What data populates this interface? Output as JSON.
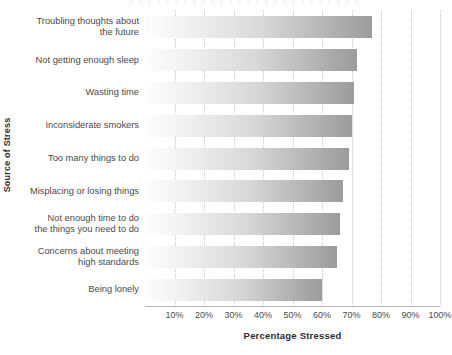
{
  "chart_data": {
    "type": "bar",
    "orientation": "horizontal",
    "title": "",
    "xlabel": "Percentage  Stressed",
    "ylabel": "Source of Stress",
    "categories": [
      "Troubling thoughts about the future",
      "Not getting enough sleep",
      "Wasting time",
      "Inconsiderate smokers",
      "Too many things to do",
      "Misplacing or losing things",
      "Not enough time to do the things you need to do",
      "Concerns about meeting high standards",
      "Being lonely"
    ],
    "category_lines": [
      [
        "Troubling thoughts about",
        "the future"
      ],
      [
        "Not getting enough sleep"
      ],
      [
        "Wasting time"
      ],
      [
        "Inconsiderate smokers"
      ],
      [
        "Too many things to do"
      ],
      [
        "Misplacing or losing things"
      ],
      [
        "Not enough time to do",
        "the things you need to do"
      ],
      [
        "Concerns about meeting",
        "high standards"
      ],
      [
        "Being lonely"
      ]
    ],
    "values": [
      77,
      72,
      71,
      70,
      69,
      67,
      66,
      65,
      60
    ],
    "xlim": [
      0,
      100
    ],
    "xticks": [
      10,
      20,
      30,
      40,
      50,
      60,
      70,
      80,
      90,
      100
    ],
    "xtick_labels": [
      "10%",
      "20%",
      "30%",
      "40%",
      "50%",
      "60%",
      "70%",
      "80%",
      "90%",
      "100%"
    ],
    "grid": true,
    "grid_axis": "x",
    "grid_style": "dotted",
    "legend": false,
    "bar_fill": "grayscale-gradient-left-to-right",
    "bar_color_light": "#fdfdfd",
    "bar_color_dark": "#9b9b9b",
    "grid_color": "#c9c9c9",
    "axis_color": "#b9b9b9",
    "text_color": "#4a4a4a"
  }
}
